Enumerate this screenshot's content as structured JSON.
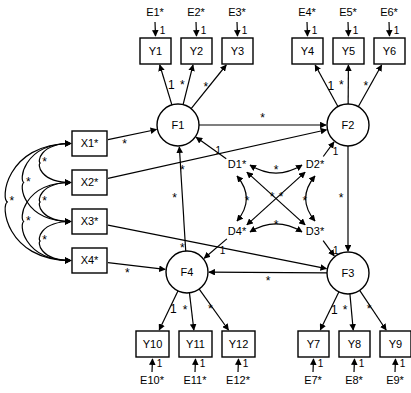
{
  "diagram": {
    "type": "sem-path-diagram",
    "width": 411,
    "height": 393,
    "background_color": "#ffffff",
    "stroke_color": "#000000",
    "fixed_label": "1",
    "free_label": "*"
  },
  "latent_factors": [
    {
      "id": "F1",
      "label": "F1",
      "cx": 178,
      "cy": 125,
      "r": 21
    },
    {
      "id": "F2",
      "label": "F2",
      "cx": 348,
      "cy": 125,
      "r": 21
    },
    {
      "id": "F3",
      "label": "F3",
      "cx": 348,
      "cy": 273,
      "r": 21
    },
    {
      "id": "F4",
      "label": "F4",
      "cx": 187,
      "cy": 272,
      "r": 21
    }
  ],
  "observed_indicators": [
    {
      "id": "Y1",
      "label": "Y1",
      "x": 140,
      "y": 38,
      "w": 31,
      "h": 26,
      "factor": "F1",
      "loading": "1"
    },
    {
      "id": "Y2",
      "label": "Y2",
      "x": 181,
      "y": 38,
      "w": 31,
      "h": 26,
      "factor": "F1",
      "loading": "*"
    },
    {
      "id": "Y3",
      "label": "Y3",
      "x": 222,
      "y": 38,
      "w": 31,
      "h": 26,
      "factor": "F1",
      "loading": "*"
    },
    {
      "id": "Y4",
      "label": "Y4",
      "x": 292,
      "y": 38,
      "w": 31,
      "h": 26,
      "factor": "F2",
      "loading": "1"
    },
    {
      "id": "Y5",
      "label": "Y5",
      "x": 333,
      "y": 38,
      "w": 31,
      "h": 26,
      "factor": "F2",
      "loading": "*"
    },
    {
      "id": "Y6",
      "label": "Y6",
      "x": 374,
      "y": 38,
      "w": 31,
      "h": 26,
      "factor": "F2",
      "loading": "*"
    },
    {
      "id": "Y10",
      "label": "Y10",
      "x": 136,
      "y": 331,
      "w": 33,
      "h": 26,
      "factor": "F4",
      "loading": "1"
    },
    {
      "id": "Y11",
      "label": "Y11",
      "x": 179,
      "y": 331,
      "w": 33,
      "h": 26,
      "factor": "F4",
      "loading": "*"
    },
    {
      "id": "Y12",
      "label": "Y12",
      "x": 222,
      "y": 331,
      "w": 33,
      "h": 26,
      "factor": "F4",
      "loading": "*"
    },
    {
      "id": "Y7",
      "label": "Y7",
      "x": 298,
      "y": 331,
      "w": 31,
      "h": 26,
      "factor": "F3",
      "loading": "1"
    },
    {
      "id": "Y8",
      "label": "Y8",
      "x": 339,
      "y": 331,
      "w": 31,
      "h": 26,
      "factor": "F3",
      "loading": "*"
    },
    {
      "id": "Y9",
      "label": "Y9",
      "x": 380,
      "y": 331,
      "w": 31,
      "h": 26,
      "factor": "F3",
      "loading": "*"
    }
  ],
  "exogenous_variables": [
    {
      "id": "X1",
      "label": "X1*",
      "x": 72,
      "y": 131,
      "w": 35,
      "h": 25
    },
    {
      "id": "X2",
      "label": "X2*",
      "x": 72,
      "y": 170,
      "w": 35,
      "h": 25
    },
    {
      "id": "X3",
      "label": "X3*",
      "x": 72,
      "y": 209,
      "w": 35,
      "h": 25
    },
    {
      "id": "X4",
      "label": "X4*",
      "x": 72,
      "y": 248,
      "w": 35,
      "h": 25
    }
  ],
  "error_terms": [
    {
      "id": "E1",
      "label": "E1*",
      "x": 155,
      "y": 13,
      "target": "Y1",
      "coefficient": "1"
    },
    {
      "id": "E2",
      "label": "E2*",
      "x": 196,
      "y": 13,
      "target": "Y2",
      "coefficient": "1"
    },
    {
      "id": "E3",
      "label": "E3*",
      "x": 237,
      "y": 13,
      "target": "Y3",
      "coefficient": "1"
    },
    {
      "id": "E4",
      "label": "E4*",
      "x": 307,
      "y": 13,
      "target": "Y4",
      "coefficient": "1"
    },
    {
      "id": "E5",
      "label": "E5*",
      "x": 348,
      "y": 13,
      "target": "Y5",
      "coefficient": "1"
    },
    {
      "id": "E6",
      "label": "E6*",
      "x": 389,
      "y": 13,
      "target": "Y6",
      "coefficient": "1"
    },
    {
      "id": "E10",
      "label": "E10*",
      "x": 152,
      "y": 381,
      "target": "Y10",
      "coefficient": "1"
    },
    {
      "id": "E11",
      "label": "E11*",
      "x": 195,
      "y": 381,
      "target": "Y11",
      "coefficient": "1"
    },
    {
      "id": "E12",
      "label": "E12*",
      "x": 238,
      "y": 381,
      "target": "Y12",
      "coefficient": "1"
    },
    {
      "id": "E7",
      "label": "E7*",
      "x": 313,
      "y": 381,
      "target": "Y7",
      "coefficient": "1"
    },
    {
      "id": "E8",
      "label": "E8*",
      "x": 354,
      "y": 381,
      "target": "Y8",
      "coefficient": "1"
    },
    {
      "id": "E9",
      "label": "E9*",
      "x": 395,
      "y": 381,
      "target": "Y9",
      "coefficient": "1"
    }
  ],
  "disturbance_terms": [
    {
      "id": "D1",
      "label": "D1*",
      "x": 237,
      "y": 165,
      "target": "F1",
      "coefficient": "1"
    },
    {
      "id": "D2",
      "label": "D2*",
      "x": 315,
      "y": 165,
      "target": "F2",
      "coefficient": "1"
    },
    {
      "id": "D3",
      "label": "D3*",
      "x": 315,
      "y": 232,
      "target": "F3",
      "coefficient": "1"
    },
    {
      "id": "D4",
      "label": "D4*",
      "x": 237,
      "y": 232,
      "target": "F4",
      "coefficient": "1"
    }
  ],
  "structural_paths": [
    {
      "id": "F1-F2",
      "from": "F1",
      "to": "F2",
      "label": "*"
    },
    {
      "id": "F2-F3",
      "from": "F2",
      "to": "F3",
      "label": "*"
    },
    {
      "id": "F3-F4",
      "from": "F3",
      "to": "F4",
      "label": "*"
    },
    {
      "id": "F4-F1",
      "from": "F4",
      "to": "F1",
      "label": "*"
    }
  ],
  "regression_paths": [
    {
      "id": "X1-F1",
      "from": "X1",
      "to": "F1",
      "label": "*"
    },
    {
      "id": "X2-F2",
      "from": "X2",
      "to": "F2",
      "label": "*"
    },
    {
      "id": "X3-F3",
      "from": "X3",
      "to": "F3",
      "label": "*"
    },
    {
      "id": "X4-F4",
      "from": "X4",
      "to": "F4",
      "label": "*"
    }
  ],
  "exogenous_covariances": [
    {
      "id": "X1-X2",
      "between": [
        "X1",
        "X2"
      ],
      "label": "*"
    },
    {
      "id": "X2-X3",
      "between": [
        "X2",
        "X3"
      ],
      "label": "*"
    },
    {
      "id": "X3-X4",
      "between": [
        "X3",
        "X4"
      ],
      "label": "*"
    },
    {
      "id": "X1-X3",
      "between": [
        "X1",
        "X3"
      ],
      "label": "*"
    },
    {
      "id": "X2-X4",
      "between": [
        "X2",
        "X4"
      ],
      "label": "*"
    },
    {
      "id": "X1-X4",
      "between": [
        "X1",
        "X4"
      ],
      "label": "*"
    }
  ],
  "disturbance_covariances": [
    {
      "id": "D1-D2",
      "between": [
        "D1",
        "D2"
      ],
      "label": "*"
    },
    {
      "id": "D2-D3",
      "between": [
        "D2",
        "D3"
      ],
      "label": "*"
    },
    {
      "id": "D3-D4",
      "between": [
        "D3",
        "D4"
      ],
      "label": "*"
    },
    {
      "id": "D1-D4",
      "between": [
        "D1",
        "D4"
      ],
      "label": "*"
    },
    {
      "id": "D1-D3",
      "between": [
        "D1",
        "D3"
      ],
      "label": "*"
    },
    {
      "id": "D2-D4",
      "between": [
        "D2",
        "D4"
      ],
      "label": "*"
    }
  ]
}
